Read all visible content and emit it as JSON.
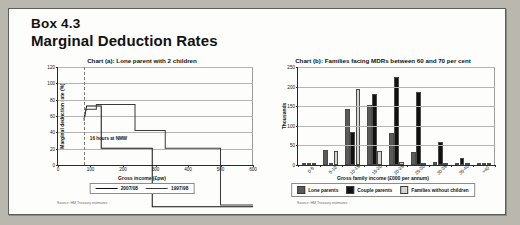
{
  "box": {
    "number": "Box 4.3",
    "title": "Marginal Deduction Rates"
  },
  "colors": {
    "lone_parents": "#5a5a5a",
    "couple_parents": "#111111",
    "families_without_children": "#d5d5d1",
    "line_2007_08": "#111111",
    "line_1997_98": "#3a3a3a",
    "gridline": "#b4b4b4",
    "axis": "#2a2a2a",
    "page_background": "#fdfdfb"
  },
  "chart_data": [
    {
      "id": "chart-a",
      "type": "line",
      "title": "Chart (a): Lone parent with 2 children",
      "xlabel": "Gross income (£pw)",
      "ylabel": "Marginal deduction rate (%)",
      "xlim": [
        0,
        600
      ],
      "ylim": [
        0,
        120
      ],
      "xticks": [
        0,
        100,
        200,
        300,
        400,
        500,
        600
      ],
      "xtick_labels": [
        "0",
        "100",
        "200",
        "300",
        "400",
        "500",
        "600"
      ],
      "yticks": [
        0,
        20,
        40,
        60,
        80,
        100,
        120
      ],
      "ytick_labels": [
        "0",
        "20",
        "40",
        "60",
        "80",
        "100",
        "120"
      ],
      "grid": true,
      "legend_position": "below",
      "annotations": [
        {
          "label": "16 hours at NMW",
          "x": 80,
          "style": "dashed-vertical"
        }
      ],
      "series": [
        {
          "name": "2007/08",
          "style": "step",
          "color": "#111111",
          "points": [
            {
              "x": 80,
              "y": 87
            },
            {
              "x": 88,
              "y": 96
            },
            {
              "x": 133,
              "y": 96
            },
            {
              "x": 133,
              "y": 70
            },
            {
              "x": 290,
              "y": 70
            },
            {
              "x": 290,
              "y": 34
            },
            {
              "x": 600,
              "y": 34
            }
          ]
        },
        {
          "name": "1997/98",
          "style": "step",
          "color": "#3a3a3a",
          "points": [
            {
              "x": 80,
              "y": 88
            },
            {
              "x": 86,
              "y": 94
            },
            {
              "x": 118,
              "y": 94
            },
            {
              "x": 118,
              "y": 97
            },
            {
              "x": 237,
              "y": 97
            },
            {
              "x": 237,
              "y": 81
            },
            {
              "x": 330,
              "y": 81
            },
            {
              "x": 330,
              "y": 70
            },
            {
              "x": 500,
              "y": 70
            },
            {
              "x": 500,
              "y": 35
            },
            {
              "x": 600,
              "y": 35
            }
          ]
        }
      ],
      "source": "Source: HM Treasury estimates"
    },
    {
      "id": "chart-b",
      "type": "bar",
      "title": "Chart (b): Families facing MDRs between 60 and 70 per cent",
      "xlabel": "Gross family income (£000 per annum)",
      "ylabel": "Thousands",
      "ylim": [
        0,
        250
      ],
      "yticks": [
        0,
        50,
        100,
        150,
        200,
        250
      ],
      "ytick_labels": [
        "0",
        "50",
        "100",
        "150",
        "200",
        "250"
      ],
      "grid": true,
      "legend_position": "below",
      "categories": [
        "0-5",
        "5-10",
        "10-15",
        "15-20",
        "20-25",
        "25-30",
        "30-35",
        "35-40",
        ">40"
      ],
      "series": [
        {
          "name": "Lone parents",
          "color": "#5a5a5a",
          "values": [
            3,
            38,
            143,
            152,
            81,
            34,
            8,
            3,
            4
          ]
        },
        {
          "name": "Couple parents",
          "color": "#111111",
          "values": [
            2,
            4,
            84,
            180,
            224,
            187,
            59,
            18,
            3
          ]
        },
        {
          "name": "Families without children",
          "color": "#d5d5d1",
          "values": [
            1,
            35,
            194,
            37,
            7,
            2,
            1,
            1,
            5
          ]
        }
      ],
      "source": "Source: HM Treasury estimates"
    }
  ]
}
